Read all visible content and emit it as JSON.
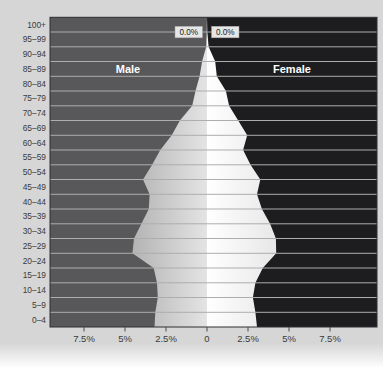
{
  "chart_data": {
    "type": "area",
    "subtype": "population-pyramid",
    "title": "",
    "categories_top_to_bottom": [
      "100+",
      "95–99",
      "90–94",
      "85–89",
      "80–84",
      "75–79",
      "70–74",
      "65–69",
      "60–64",
      "55–59",
      "50–54",
      "45–49",
      "40–44",
      "35–39",
      "30–34",
      "25–29",
      "20–24",
      "15–19",
      "10–14",
      "5–9",
      "0–4"
    ],
    "series": [
      {
        "name": "Male",
        "side": "left",
        "values_pct_top_to_bottom": [
          0.0,
          0.0,
          0.2,
          0.4,
          0.6,
          0.8,
          1.3,
          1.9,
          2.5,
          3.1,
          3.6,
          3.7,
          3.5,
          3.8,
          4.2,
          4.5,
          3.9,
          3.2,
          3.0,
          3.1,
          3.2
        ]
      },
      {
        "name": "Female",
        "side": "right",
        "values_pct_top_to_bottom": [
          0.0,
          0.1,
          0.3,
          0.6,
          0.9,
          1.3,
          1.6,
          2.2,
          2.3,
          2.4,
          3.0,
          3.2,
          3.2,
          3.6,
          4.0,
          4.2,
          3.8,
          3.2,
          2.9,
          2.9,
          3.0
        ]
      }
    ],
    "edge_values_pct": {
      "note": "silhouette half-width (%) at each age-band boundary, top of 100+ down to bottom of 0-4",
      "male_top_to_bottom": [
        0,
        0.02,
        0.05,
        0.3,
        0.45,
        0.7,
        0.9,
        1.65,
        2.15,
        2.85,
        3.35,
        3.9,
        3.5,
        3.55,
        4.0,
        4.45,
        4.55,
        3.25,
        3.05,
        3.0,
        3.15,
        3.2
      ],
      "female_top_to_bottom": [
        0,
        0.02,
        0.1,
        0.5,
        0.6,
        1.15,
        1.35,
        1.9,
        2.45,
        2.2,
        2.65,
        3.25,
        3.05,
        3.35,
        3.85,
        4.2,
        4.22,
        3.4,
        2.95,
        2.8,
        2.95,
        3.05
      ]
    },
    "x_axis": {
      "tick_labels": [
        "7.5%",
        "5%",
        "2.5%",
        "0",
        "2.5%",
        "5%",
        "7.5%"
      ],
      "tick_values_pct": [
        -7.5,
        -5,
        -2.5,
        0,
        2.5,
        5,
        7.5
      ],
      "grid": true
    },
    "side_labels": {
      "male": "Male",
      "female": "Female"
    },
    "callouts": [
      {
        "series": "Male",
        "text": "0.0%"
      },
      {
        "series": "Female",
        "text": "0.0%"
      }
    ],
    "colors": {
      "panel_bg": "#d6d6d6",
      "male_bg": "#58585b",
      "female_bg": "#1d1d20",
      "male_fill_outer": "#b3b3b3",
      "male_fill_inner": "#e4e4e4",
      "female_fill_inner": "#ffffff",
      "female_fill_outer": "#e7e7e7",
      "gridline": "#adadad",
      "plot_border": "#2f2f32",
      "axis_text": "#3b3b3b",
      "side_label_text": "#ffffff",
      "callout_bg": "#e6e6e6",
      "callout_text": "#222222",
      "tick_mark": "#4a4a4a"
    }
  }
}
